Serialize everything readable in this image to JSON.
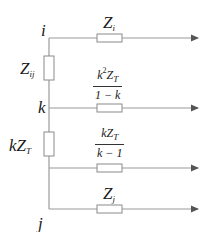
{
  "diagram": {
    "type": "circuit-equivalent",
    "nodes": [
      {
        "id": "i",
        "label": "i"
      },
      {
        "id": "k",
        "label": "k"
      },
      {
        "id": "j",
        "label": "j"
      }
    ],
    "vertical_impedances": [
      {
        "between": [
          "i",
          "k"
        ],
        "label_main": "Z",
        "label_sub": "ij"
      },
      {
        "between": [
          "k",
          "j"
        ],
        "label_pre": "k",
        "label_main": "Z",
        "label_sub": "T"
      }
    ],
    "branches": [
      {
        "from": "i",
        "label_main": "Z",
        "label_sub": "i"
      },
      {
        "from": "k",
        "numerator": {
          "k": "k",
          "exp": "2",
          "Z": "Z",
          "sub": "T"
        },
        "denominator": "1 − k"
      },
      {
        "from": "kZT-junction",
        "numerator": {
          "k": "k",
          "Z": "Z",
          "sub": "T"
        },
        "denominator": "k − 1"
      },
      {
        "from": "j",
        "label_main": "Z",
        "label_sub": "j"
      }
    ],
    "colors": {
      "line": "#9a9a9a",
      "text": "#1a1a1a",
      "resistor_border": "#8a8a8a",
      "arrow": "#555555"
    }
  }
}
